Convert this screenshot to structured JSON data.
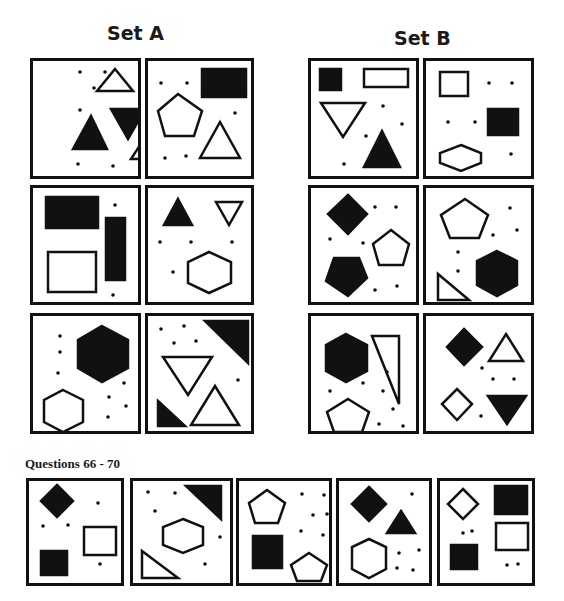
{
  "set_a": {
    "title": "Set A",
    "panels": [
      {
        "x": 30,
        "y": 58,
        "w": 111,
        "h": 121,
        "shapes": [
          {
            "t": "tri",
            "f": 0,
            "pts": "82,8 100,30 64,30"
          },
          {
            "t": "tri",
            "f": 1,
            "pts": "78,48 112,48 95,78"
          },
          {
            "t": "tri",
            "f": 1,
            "pts": "58,55 74,88 40,88"
          },
          {
            "t": "tri",
            "f": 0,
            "pts": "115,72 131,98 98,98"
          },
          {
            "t": "dots",
            "pts": [
              [
                47,
                11
              ],
              [
                72,
                11
              ],
              [
                61,
                27
              ],
              [
                47,
                49
              ],
              [
                45,
                103
              ],
              [
                80,
                105
              ]
            ]
          }
        ]
      },
      {
        "x": 145,
        "y": 58,
        "w": 109,
        "h": 121,
        "shapes": [
          {
            "t": "rect",
            "f": 1,
            "x": 54,
            "y": 8,
            "w": 44,
            "h": 28
          },
          {
            "t": "poly",
            "f": 0,
            "pts": "30,33 54,50 46,75 17,75 10,50"
          },
          {
            "t": "tri",
            "f": 0,
            "pts": "72,61 92,97 52,97"
          },
          {
            "t": "dots",
            "pts": [
              [
                13,
                22
              ],
              [
                39,
                22
              ],
              [
                87,
                52
              ],
              [
                17,
                97
              ],
              [
                38,
                95
              ]
            ]
          }
        ]
      },
      {
        "x": 30,
        "y": 185,
        "w": 111,
        "h": 120,
        "shapes": [
          {
            "t": "rect",
            "f": 1,
            "x": 13,
            "y": 9,
            "w": 52,
            "h": 31
          },
          {
            "t": "rect",
            "f": 1,
            "x": 73,
            "y": 30,
            "w": 19,
            "h": 62
          },
          {
            "t": "rect",
            "f": 0,
            "x": 15,
            "y": 64,
            "w": 48,
            "h": 40
          },
          {
            "t": "dots",
            "pts": [
              [
                82,
                17
              ],
              [
                80,
                107
              ]
            ]
          }
        ]
      },
      {
        "x": 145,
        "y": 185,
        "w": 109,
        "h": 120,
        "shapes": [
          {
            "t": "tri",
            "f": 1,
            "pts": "30,11 44,37 16,37"
          },
          {
            "t": "tri",
            "f": 0,
            "pts": "68,14 94,14 81,37"
          },
          {
            "t": "poly",
            "f": 0,
            "pts": "61,64 83,74 83,95 61,105 40,95 40,74"
          },
          {
            "t": "dots",
            "pts": [
              [
                12,
                54
              ],
              [
                43,
                54
              ],
              [
                84,
                54
              ],
              [
                25,
                84
              ]
            ]
          }
        ]
      },
      {
        "x": 30,
        "y": 313,
        "w": 111,
        "h": 121,
        "shapes": [
          {
            "t": "poly",
            "f": 1,
            "pts": "69,10 95,24 95,52 69,66 45,52 45,24"
          },
          {
            "t": "poly",
            "f": 0,
            "pts": "30,74 50,84 50,106 30,116 11,106 11,84"
          },
          {
            "t": "dots",
            "pts": [
              [
                27,
                20
              ],
              [
                27,
                36
              ],
              [
                25,
                57
              ],
              [
                91,
                67
              ],
              [
                76,
                81
              ],
              [
                93,
                90
              ],
              [
                75,
                101
              ]
            ]
          }
        ]
      },
      {
        "x": 145,
        "y": 313,
        "w": 109,
        "h": 121,
        "shapes": [
          {
            "t": "tri",
            "f": 1,
            "pts": "57,5 100,5 100,47"
          },
          {
            "t": "tri",
            "f": 0,
            "pts": "15,41 64,41 40,79"
          },
          {
            "t": "tri",
            "f": 1,
            "pts": "10,85 37,110 10,110"
          },
          {
            "t": "tri",
            "f": 0,
            "pts": "67,70 91,109 43,109"
          },
          {
            "t": "dots",
            "pts": [
              [
                13,
                13
              ],
              [
                36,
                10
              ],
              [
                26,
                27
              ],
              [
                48,
                25
              ],
              [
                90,
                64
              ]
            ]
          }
        ]
      }
    ]
  },
  "set_b": {
    "title": "Set B",
    "panels": [
      {
        "x": 308,
        "y": 58,
        "w": 111,
        "h": 121,
        "shapes": [
          {
            "t": "rect",
            "f": 1,
            "x": 9,
            "y": 8,
            "w": 21,
            "h": 21
          },
          {
            "t": "rect",
            "f": 0,
            "x": 53,
            "y": 8,
            "w": 44,
            "h": 18
          },
          {
            "t": "tri",
            "f": 0,
            "pts": "10,42 54,42 32,76"
          },
          {
            "t": "tri",
            "f": 1,
            "pts": "71,70 89,106 53,106"
          },
          {
            "t": "dots",
            "pts": [
              [
                72,
                45
              ],
              [
                91,
                63
              ],
              [
                55,
                75
              ],
              [
                33,
                103
              ]
            ]
          }
        ]
      },
      {
        "x": 423,
        "y": 58,
        "w": 111,
        "h": 121,
        "shapes": [
          {
            "t": "rect",
            "f": 0,
            "x": 14,
            "y": 11,
            "w": 28,
            "h": 24
          },
          {
            "t": "rect",
            "f": 1,
            "x": 62,
            "y": 48,
            "w": 30,
            "h": 26
          },
          {
            "t": "poly",
            "f": 0,
            "pts": "35,84 55,92 55,102 35,110 14,102 14,92"
          },
          {
            "t": "dots",
            "pts": [
              [
                63,
                22
              ],
              [
                86,
                22
              ],
              [
                22,
                61
              ],
              [
                49,
                61
              ],
              [
                85,
                93
              ]
            ]
          }
        ]
      },
      {
        "x": 308,
        "y": 185,
        "w": 111,
        "h": 120,
        "shapes": [
          {
            "t": "poly",
            "f": 1,
            "pts": "37,7 56,26 37,46 17,26"
          },
          {
            "t": "poly",
            "f": 0,
            "pts": "80,42 98,56 92,77 68,77 62,56"
          },
          {
            "t": "poly",
            "f": 1,
            "pts": "23,70 48,70 56,90 37,108 15,93"
          },
          {
            "t": "dots",
            "pts": [
              [
                64,
                19
              ],
              [
                85,
                19
              ],
              [
                19,
                51
              ],
              [
                52,
                55
              ],
              [
                64,
                102
              ],
              [
                86,
                98
              ]
            ]
          }
        ]
      },
      {
        "x": 423,
        "y": 185,
        "w": 111,
        "h": 120,
        "shapes": [
          {
            "t": "poly",
            "f": 0,
            "pts": "39,11 62,27 53,50 24,50 15,27"
          },
          {
            "t": "poly",
            "f": 1,
            "pts": "71,63 91,73 91,97 71,108 51,97 51,73"
          },
          {
            "t": "tri",
            "f": 0,
            "pts": "12,86 12,112 43,112"
          },
          {
            "t": "dots",
            "pts": [
              [
                84,
                20
              ],
              [
                91,
                42
              ],
              [
                67,
                47
              ],
              [
                32,
                64
              ],
              [
                32,
                83
              ]
            ]
          }
        ]
      },
      {
        "x": 308,
        "y": 313,
        "w": 111,
        "h": 121,
        "shapes": [
          {
            "t": "poly",
            "f": 1,
            "pts": "35,18 56,29 56,55 35,66 15,55 15,29"
          },
          {
            "t": "tri",
            "f": 0,
            "pts": "61,20 88,20 88,88"
          },
          {
            "t": "poly",
            "f": 0,
            "pts": "37,83 58,96 51,116 23,116 16,96"
          },
          {
            "t": "dots",
            "pts": [
              [
                76,
                56
              ],
              [
                52,
                67
              ],
              [
                19,
                75
              ],
              [
                72,
                75
              ],
              [
                82,
                93
              ],
              [
                68,
                108
              ],
              [
                92,
                110
              ]
            ]
          }
        ]
      },
      {
        "x": 423,
        "y": 313,
        "w": 111,
        "h": 121,
        "shapes": [
          {
            "t": "poly",
            "f": 1,
            "pts": "38,13 56,31 38,49 21,31"
          },
          {
            "t": "tri",
            "f": 0,
            "pts": "80,18 97,45 63,45"
          },
          {
            "t": "poly",
            "f": 0,
            "pts": "31,73 46,88 31,104 16,88"
          },
          {
            "t": "tri",
            "f": 1,
            "pts": "62,80 100,80 81,108"
          },
          {
            "t": "dots",
            "pts": [
              [
                56,
                52
              ],
              [
                67,
                63
              ],
              [
                88,
                63
              ],
              [
                55,
                100
              ]
            ]
          }
        ]
      }
    ]
  },
  "questions": {
    "label": "Questions 66 - 70",
    "panels": [
      {
        "x": 26,
        "y": 478,
        "w": 98,
        "h": 108,
        "shapes": [
          {
            "t": "poly",
            "f": 1,
            "pts": "28,4 44,20 28,36 12,20"
          },
          {
            "t": "rect",
            "f": 0,
            "x": 55,
            "y": 46,
            "w": 32,
            "h": 28
          },
          {
            "t": "rect",
            "f": 1,
            "x": 12,
            "y": 70,
            "w": 26,
            "h": 24
          },
          {
            "t": "dots",
            "pts": [
              [
                69,
                22
              ],
              [
                14,
                45
              ],
              [
                39,
                44
              ],
              [
                71,
                83
              ]
            ]
          }
        ]
      },
      {
        "x": 130,
        "y": 478,
        "w": 103,
        "h": 108,
        "shapes": [
          {
            "t": "tri",
            "f": 1,
            "pts": "53,5 88,5 88,38"
          },
          {
            "t": "poly",
            "f": 0,
            "pts": "50,38 70,46 70,64 50,72 30,64 30,46"
          },
          {
            "t": "tri",
            "f": 0,
            "pts": "9,70 9,97 45,97"
          },
          {
            "t": "dots",
            "pts": [
              [
                15,
                11
              ],
              [
                42,
                12
              ],
              [
                22,
                30
              ],
              [
                87,
                56
              ],
              [
                72,
                83
              ]
            ]
          }
        ]
      },
      {
        "x": 236,
        "y": 478,
        "w": 96,
        "h": 108,
        "shapes": [
          {
            "t": "poly",
            "f": 0,
            "pts": "28,9 46,22 39,42 16,42 10,22"
          },
          {
            "t": "rect",
            "f": 1,
            "x": 14,
            "y": 55,
            "w": 29,
            "h": 32
          },
          {
            "t": "poly",
            "f": 0,
            "pts": "70,72 88,84 82,100 58,100 52,84"
          },
          {
            "t": "dots",
            "pts": [
              [
                63,
                13
              ],
              [
                85,
                14
              ],
              [
                74,
                34
              ],
              [
                88,
                33
              ],
              [
                62,
                50
              ],
              [
                84,
                54
              ]
            ]
          }
        ]
      },
      {
        "x": 336,
        "y": 478,
        "w": 96,
        "h": 108,
        "shapes": [
          {
            "t": "poly",
            "f": 1,
            "pts": "30,6 47,23 30,40 13,23"
          },
          {
            "t": "tri",
            "f": 1,
            "pts": "62,30 76,52 48,52"
          },
          {
            "t": "poly",
            "f": 0,
            "pts": "30,58 47,66 47,88 30,97 13,88 13,66"
          },
          {
            "t": "dots",
            "pts": [
              [
                73,
                13
              ],
              [
                60,
                72
              ],
              [
                80,
                69
              ],
              [
                58,
                87
              ],
              [
                74,
                89
              ]
            ]
          }
        ]
      },
      {
        "x": 437,
        "y": 478,
        "w": 98,
        "h": 108,
        "shapes": [
          {
            "t": "poly",
            "f": 0,
            "pts": "23,8 38,23 23,38 8,23"
          },
          {
            "t": "rect",
            "f": 1,
            "x": 55,
            "y": 5,
            "w": 32,
            "h": 28
          },
          {
            "t": "rect",
            "f": 0,
            "x": 56,
            "y": 42,
            "w": 32,
            "h": 27
          },
          {
            "t": "rect",
            "f": 1,
            "x": 11,
            "y": 64,
            "w": 26,
            "h": 24
          },
          {
            "t": "dots",
            "pts": [
              [
                23,
                52
              ],
              [
                32,
                50
              ],
              [
                67,
                84
              ],
              [
                78,
                83
              ]
            ]
          }
        ]
      }
    ]
  },
  "colors": {
    "ink": "#111111",
    "paper": "#ffffff"
  }
}
